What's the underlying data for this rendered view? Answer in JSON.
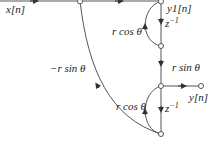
{
  "diagram": {
    "type": "signal-flow-graph",
    "colors": {
      "line": "#555555",
      "text": "#222222",
      "node_fill": "#ffffff"
    },
    "labels": {
      "input": "x[n]",
      "intermediate_output": "y1[n]",
      "output": "y[n]",
      "delay_top": "z",
      "delay_top_exp": "−1",
      "delay_bottom": "z",
      "delay_bottom_exp": "−1",
      "gain_top_loop": "r cos θ",
      "gain_vertical": "r sin θ",
      "gain_feedback": "−r sin θ",
      "gain_bottom_loop": "r cos θ"
    },
    "nodes": [
      {
        "id": "n1",
        "label": "input-branch"
      },
      {
        "id": "n2",
        "label": "y1-node"
      },
      {
        "id": "n3",
        "label": "delay1-output"
      },
      {
        "id": "n4",
        "label": "y-node"
      },
      {
        "id": "n5",
        "label": "delay2-output"
      },
      {
        "id": "n6",
        "label": "output-terminal"
      }
    ]
  }
}
